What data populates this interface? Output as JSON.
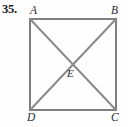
{
  "figure": {
    "problem_number": "35.",
    "width": 128,
    "height": 127,
    "background_color": "#fefefe",
    "stroke_color": "#808080",
    "label_color": "#2a2a2a",
    "number_color": "#1b1b1b",
    "stroke_width": 2
  },
  "labels": {
    "a": "A",
    "b": "B",
    "c": "C",
    "d": "D",
    "e": "E"
  },
  "geometry": {
    "shape": "square-with-diagonals",
    "vertices": [
      {
        "name": "A",
        "x": 30,
        "y": 19
      },
      {
        "name": "B",
        "x": 116,
        "y": 19
      },
      {
        "name": "C",
        "x": 116,
        "y": 110
      },
      {
        "name": "D",
        "x": 30,
        "y": 110
      }
    ],
    "intersection": {
      "name": "E",
      "x": 73,
      "y": 64.5
    },
    "sides": [
      {
        "from": "A",
        "to": "B"
      },
      {
        "from": "B",
        "to": "C"
      },
      {
        "from": "C",
        "to": "D"
      },
      {
        "from": "D",
        "to": "A"
      }
    ],
    "diagonals": [
      {
        "from": "A",
        "to": "C"
      },
      {
        "from": "B",
        "to": "D"
      }
    ]
  }
}
